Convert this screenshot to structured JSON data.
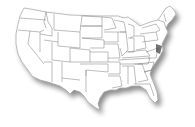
{
  "map": {
    "title": "",
    "region": "United States (contiguous)",
    "style": "blank state outline map",
    "colors": {
      "background": "#ffffff",
      "state_fill": "#ffffff",
      "border": "#7a7a7a",
      "shadow": "#999999",
      "highlight_region": "#333333"
    }
  }
}
